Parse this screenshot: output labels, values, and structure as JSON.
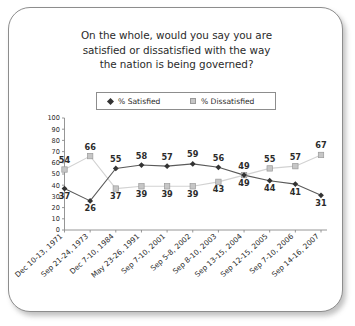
{
  "card": {
    "title_lines": [
      "On the whole, would you say you are",
      "satisfied or dissatisfied with the way",
      "the nation is being governed?"
    ]
  },
  "legend": {
    "satisfied_label": "% Satisfied",
    "dissatisfied_label": "% Dissatisfied",
    "satisfied_marker": "diamond-marker-icon",
    "dissatisfied_marker": "square-marker-icon"
  },
  "colors": {
    "satisfied": "#333333",
    "satisfied_line": "#5a5a5a",
    "dissatisfied": "#c6c6c6",
    "dissatisfied_line": "#d2d2d2",
    "axis": "#8a8a8a",
    "text": "#2b2b2b",
    "card_border": "#8d8d8d"
  },
  "chart_data": {
    "type": "line",
    "title": "On the whole, would you say you are satisfied or dissatisfied with the way the nation is being governed?",
    "xlabel": "",
    "ylabel": "",
    "ylim": [
      0,
      100
    ],
    "yticks": [
      0,
      10,
      20,
      30,
      40,
      50,
      60,
      70,
      80,
      90,
      100
    ],
    "ytick_labels": [
      "0",
      "10",
      "20",
      "30",
      "40",
      "50",
      "60",
      "70",
      "80",
      "90",
      "100"
    ],
    "grid": false,
    "legend_position": "top",
    "categories": [
      "Dec 10-13, 1971",
      "Sep 21-24, 1973",
      "Dec 7-10, 1984",
      "May 23-26, 1991",
      "Sep 7-10, 2001",
      "Sep 5-8, 2002",
      "Sep 8-10, 2003",
      "Sep 13-15, 2004",
      "Sep 12-15, 2005",
      "Sep 7-10, 2006",
      "Sep 14-16, 2007"
    ],
    "series": [
      {
        "name": "% Satisfied",
        "marker": "diamond",
        "values": [
          37,
          26,
          55,
          58,
          57,
          59,
          56,
          49,
          44,
          41,
          31
        ]
      },
      {
        "name": "% Dissatisfied",
        "marker": "square",
        "values": [
          54,
          66,
          37,
          39,
          39,
          39,
          43,
          49,
          55,
          57,
          67
        ]
      }
    ]
  }
}
